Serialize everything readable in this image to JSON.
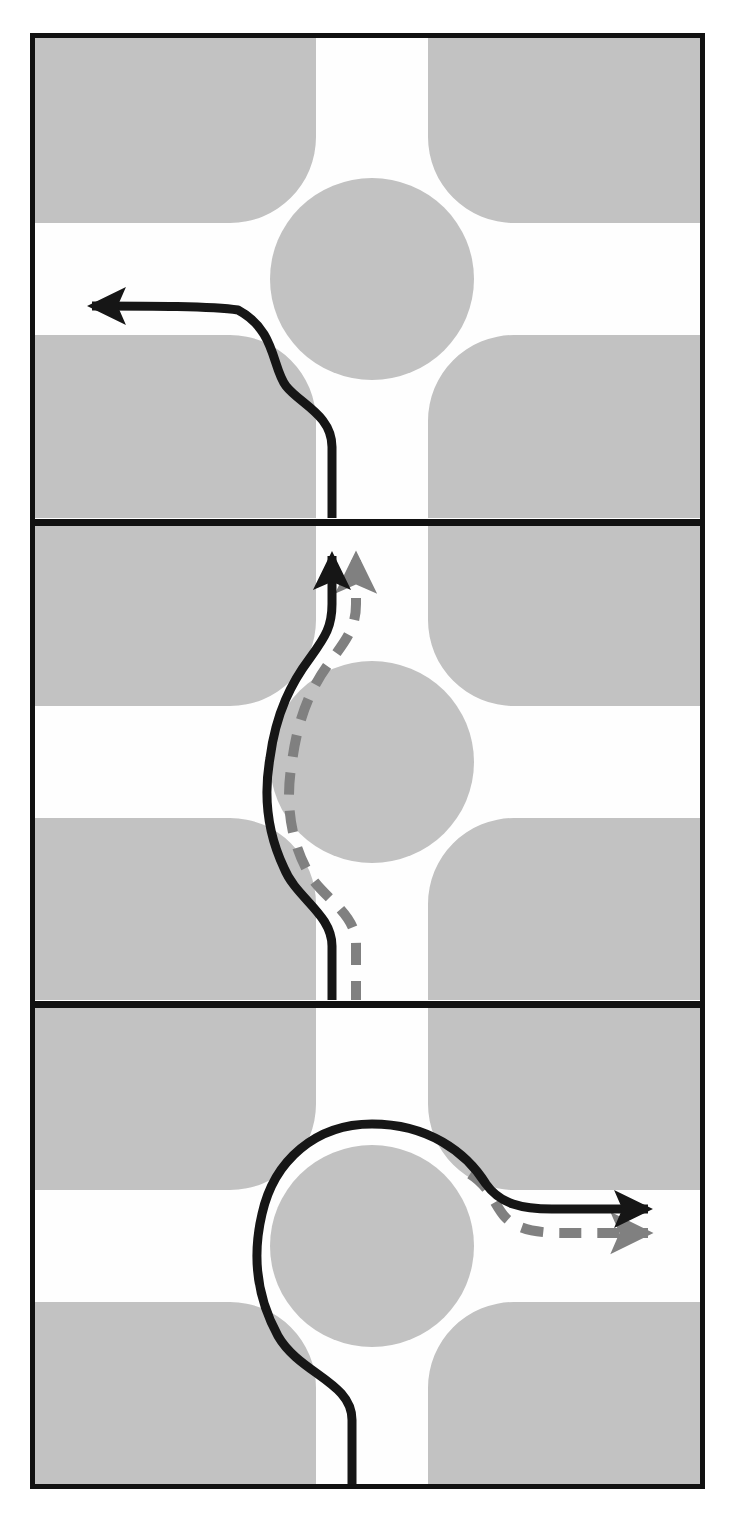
{
  "figure": {
    "title": "Roundabout vehicle path diagram",
    "panel_count": 3,
    "colors": {
      "frame_border": "#111111",
      "block_gray": "#c2c2c2",
      "road_white": "#fefefe",
      "island_gray": "#c2c2c2",
      "path_solid": "#161616",
      "path_dashed": "#808080",
      "page_background": "#ffffff"
    },
    "frame": {
      "left": 30,
      "top": 33,
      "right": 703,
      "bottom": 1489,
      "border_width": 5,
      "divider_y": [
        521,
        1003
      ]
    },
    "legend": {
      "solid_line_label": "actual vehicle path",
      "dashed_line_label": "reference / ideal path"
    }
  },
  "panels": [
    {
      "id": "panel-1",
      "index": "1",
      "name": "left-turn-panel",
      "maneuver": "left turn",
      "entry_arm": "south",
      "exit_arm": "west",
      "paths": [
        {
          "style": "solid",
          "color": "#161616",
          "arrow": "west",
          "label": "vehicle path"
        }
      ],
      "arrow_head": {
        "direction": "left",
        "x": 78,
        "y": 306
      }
    },
    {
      "id": "panel-2",
      "index": "2",
      "name": "through-movement-panel",
      "maneuver": "straight through",
      "entry_arm": "south",
      "exit_arm": "north",
      "paths": [
        {
          "style": "solid",
          "color": "#161616",
          "arrow": "north",
          "label": "vehicle path"
        },
        {
          "style": "dashed",
          "color": "#808080",
          "arrow": "north",
          "label": "reference path"
        }
      ],
      "arrow_heads": [
        {
          "direction": "up",
          "x": 332,
          "y": 540,
          "color": "#161616"
        },
        {
          "direction": "up",
          "x": 356,
          "y": 540,
          "color": "#808080"
        }
      ]
    },
    {
      "id": "panel-3",
      "index": "3",
      "name": "right-turn-panel",
      "maneuver": "three-quarter circulation to east exit",
      "entry_arm": "south",
      "exit_arm": "east",
      "paths": [
        {
          "style": "solid",
          "color": "#161616",
          "arrow": "east",
          "label": "vehicle path"
        },
        {
          "style": "dashed",
          "color": "#808080",
          "arrow": "east",
          "label": "reference path"
        }
      ],
      "arrow_heads": [
        {
          "direction": "right",
          "x": 658,
          "y": 1209,
          "color": "#161616"
        },
        {
          "direction": "right",
          "x": 658,
          "y": 1233,
          "color": "#808080"
        }
      ]
    }
  ],
  "geometry": {
    "roundabout": {
      "island_rx": 102,
      "island_ry": 101,
      "road_half_width": 56,
      "flare_radius": 86
    },
    "centers": [
      {
        "panel": "1",
        "cx": 372,
        "cy": 279
      },
      {
        "panel": "2",
        "cx": 372,
        "cy": 762
      },
      {
        "panel": "3",
        "cx": 372,
        "cy": 1246
      }
    ]
  }
}
